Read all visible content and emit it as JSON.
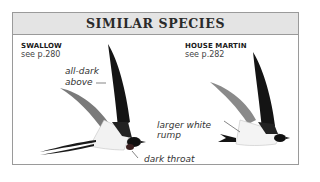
{
  "panel": {
    "title": "SIMILAR SPECIES"
  },
  "species": [
    {
      "name": "SWALLOW",
      "ref": "see p.280"
    },
    {
      "name": "HOUSE MARTIN",
      "ref": "see p.282"
    }
  ],
  "annotations": {
    "swallow_upper": "all-dark",
    "swallow_upper_2": "above",
    "swallow_throat": "dark throat",
    "martin_rump": "larger white",
    "martin_rump_2": "rump"
  },
  "colors": {
    "header_bg": "#e4e4e4",
    "border": "#9a9a9a",
    "wing_dark": "#111111",
    "wing_grey": "#7a7a7a"
  }
}
